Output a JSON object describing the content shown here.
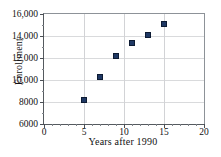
{
  "chart_data": {
    "type": "scatter",
    "title": "",
    "xlabel": "Years after 1990",
    "ylabel": "Enrollment",
    "xlim": [
      0,
      20
    ],
    "ylim": [
      6000,
      16000
    ],
    "grid": true,
    "legend": null,
    "x": [
      5,
      7,
      9,
      11,
      13,
      15
    ],
    "values": [
      8200,
      10300,
      12200,
      13400,
      14100,
      15100
    ],
    "points": [
      {
        "x": 5,
        "y": 8200
      },
      {
        "x": 7,
        "y": 10300
      },
      {
        "x": 9,
        "y": 12200
      },
      {
        "x": 11,
        "y": 13400
      },
      {
        "x": 13,
        "y": 14100
      },
      {
        "x": 15,
        "y": 15100
      }
    ],
    "xticks": [
      {
        "value": 0,
        "label": "0"
      },
      {
        "value": 5,
        "label": "5"
      },
      {
        "value": 10,
        "label": "10"
      },
      {
        "value": 15,
        "label": "15"
      },
      {
        "value": 20,
        "label": "20"
      }
    ],
    "xticks_minor": [
      1,
      2,
      3,
      4,
      6,
      7,
      8,
      9,
      11,
      12,
      13,
      14,
      16,
      17,
      18,
      19
    ],
    "yticks": [
      {
        "value": 6000,
        "label": "6000"
      },
      {
        "value": 8000,
        "label": "8000"
      },
      {
        "value": 10000,
        "label": "10,000"
      },
      {
        "value": 12000,
        "label": "12,000"
      },
      {
        "value": 14000,
        "label": "14,000"
      },
      {
        "value": 16000,
        "label": "16,000"
      }
    ],
    "yticks_minor": [
      7000,
      9000,
      11000,
      13000,
      15000
    ],
    "marker": {
      "shape": "square",
      "color": "#1f3864",
      "size": 6
    },
    "colors": {
      "marker": "#1f3864",
      "grid": "#d9dadc",
      "axis": "#555a5f",
      "text": "#111111",
      "background": "#ffffff"
    }
  }
}
